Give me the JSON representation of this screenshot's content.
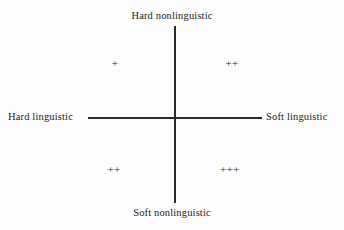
{
  "figure": {
    "type": "quadrant-diagram",
    "background_color": "#fdfdfd",
    "line_color": "#2a2a2a",
    "text_color": "#1a1a1a"
  },
  "axes": {
    "vertical": {
      "top_label": "Hard nonlinguistic",
      "bottom_label": "Soft nonlinguistic"
    },
    "horizontal": {
      "left_label": "Hard linguistic",
      "right_label": "Soft linguistic"
    }
  },
  "quadrants": [
    {
      "position": "upper-left",
      "horizontal_axis": "Hard linguistic",
      "vertical_axis": "Hard nonlinguistic",
      "marker": "+",
      "rating": 1
    },
    {
      "position": "upper-right",
      "horizontal_axis": "Soft linguistic",
      "vertical_axis": "Hard nonlinguistic",
      "marker": "++",
      "rating": 2
    },
    {
      "position": "lower-left",
      "horizontal_axis": "Hard linguistic",
      "vertical_axis": "Soft nonlinguistic",
      "marker": "++",
      "rating": 2
    },
    {
      "position": "lower-right",
      "horizontal_axis": "Soft linguistic",
      "vertical_axis": "Soft nonlinguistic",
      "marker": "+++",
      "rating": 3
    }
  ]
}
